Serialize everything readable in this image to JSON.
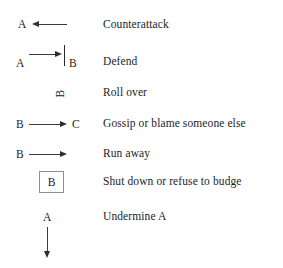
{
  "legend": {
    "title": "Conflict move notation key",
    "rows": [
      {
        "id": "counterattack",
        "label": "Counterattack",
        "symbol": {
          "kind": "arrow-left-from-node",
          "source_letter": "A",
          "direction": "left"
        }
      },
      {
        "id": "defend",
        "label": "Defend",
        "symbol": {
          "kind": "arrow-right-blocked-by-wall",
          "source_letter": "A",
          "target_letter": "B",
          "direction": "right",
          "barrier": "vertical-bar"
        }
      },
      {
        "id": "roll-over",
        "label": "Roll over",
        "symbol": {
          "kind": "rotated-letter",
          "source_letter": "B",
          "rotation_degrees": -90
        }
      },
      {
        "id": "gossip",
        "label": "Gossip or blame someone else",
        "symbol": {
          "kind": "arrow-right-to-node",
          "source_letter": "B",
          "target_letter": "C",
          "direction": "right"
        }
      },
      {
        "id": "run-away",
        "label": "Run away",
        "symbol": {
          "kind": "arrow-right-open",
          "source_letter": "B",
          "direction": "right"
        }
      },
      {
        "id": "shut-down",
        "label": "Shut down or refuse to budge",
        "symbol": {
          "kind": "boxed-letter",
          "source_letter": "B"
        }
      },
      {
        "id": "undermine",
        "label": "Undermine A",
        "symbol": {
          "kind": "arrow-down-from-node",
          "source_letter": "A",
          "direction": "down"
        }
      }
    ]
  },
  "colors": {
    "background": "#ffffff",
    "text": "#1d1d1d",
    "stroke": "#2e2e2e",
    "box_border": "#8e8e8e"
  }
}
